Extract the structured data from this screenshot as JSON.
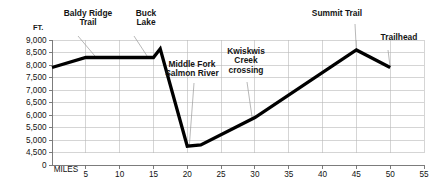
{
  "chart_data": {
    "type": "line",
    "title": "",
    "subtitle": "",
    "xlabel": "MILES",
    "ylabel": "FT.",
    "ylabel_full": "FT.",
    "x": [
      0,
      5,
      10,
      15,
      16,
      20,
      22,
      30,
      45,
      50
    ],
    "values": [
      7900,
      8300,
      8300,
      8300,
      8650,
      4750,
      4800,
      5900,
      8600,
      7900
    ],
    "series": [
      {
        "name": "Trail elevation profile",
        "x": [
          0,
          5,
          10,
          15,
          16,
          20,
          22,
          30,
          45,
          50
        ],
        "values": [
          7900,
          8300,
          8300,
          8300,
          8650,
          4750,
          4800,
          5900,
          8600,
          7900
        ]
      }
    ],
    "xlim": [
      0,
      55
    ],
    "ylim": [
      4250,
      9000
    ],
    "yticks": [
      9000,
      8500,
      8000,
      7500,
      7000,
      6500,
      6000,
      5500,
      5000,
      4500,
      0
    ],
    "ytick_labels": [
      "9,000",
      "8,500",
      "8,000",
      "7,500",
      "7,000",
      "6,500",
      "6,000",
      "5,500",
      "5,000",
      "4,500",
      "0"
    ],
    "xticks": [
      5,
      10,
      15,
      20,
      25,
      30,
      35,
      40,
      45,
      50,
      55
    ],
    "xtick_labels": [
      "5",
      "10",
      "15",
      "20",
      "25",
      "30",
      "35",
      "40",
      "45",
      "50",
      "55"
    ],
    "grid": true,
    "grid_color": "#b9b9b9",
    "legend": "none",
    "line_color": "#000000",
    "background_color": "#ffffff",
    "annotations": [
      {
        "id": "baldy-ridge-trail",
        "label": "Baldy Ridge Trail",
        "lines": [
          "Baldy Ridge",
          "Trail"
        ],
        "mile": 6.5,
        "elevation": 8310
      },
      {
        "id": "buck-lake",
        "label": "Buck Lake",
        "lines": [
          "Buck",
          "Lake"
        ],
        "mile": 14.2,
        "elevation": 8300
      },
      {
        "id": "middle-fork-salmon-river",
        "label": "Middle Fork Salmon River",
        "lines": [
          "Middle Fork",
          "Salmon River"
        ],
        "mile": 20.3,
        "elevation": 4760
      },
      {
        "id": "kwiskwis-creek-crossing",
        "label": "Kwiskwis Creek crossing",
        "lines": [
          "Kwiskwis",
          "Creek",
          "crossing"
        ],
        "mile": 29.6,
        "elevation": 5870
      },
      {
        "id": "summit-trail",
        "label": "Summit Trail",
        "lines": [
          "Summit Trail"
        ],
        "mile": 45.0,
        "elevation": 8600
      },
      {
        "id": "trailhead",
        "label": "Trailhead",
        "lines": [
          "Trailhead"
        ],
        "mile": 50.0,
        "elevation": 7900
      }
    ]
  }
}
